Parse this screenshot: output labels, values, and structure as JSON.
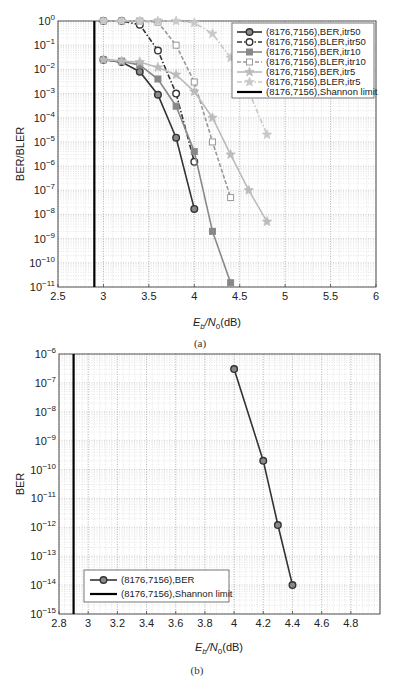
{
  "chart_data": [
    {
      "type": "line",
      "panel": "(a)",
      "caption": "(a)",
      "xlabel": "Eb/N0(dB)",
      "ylabel": "BER/BLER",
      "xscale": "linear",
      "yscale": "log",
      "xlim": [
        2.5,
        6
      ],
      "ylim": [
        1e-11,
        1
      ],
      "xticks": [
        "2.5",
        "3",
        "3.5",
        "4",
        "4.5",
        "5",
        "5.5",
        "6"
      ],
      "yticks": [
        "10^0",
        "10^-1",
        "10^-2",
        "10^-3",
        "10^-4",
        "10^-5",
        "10^-6",
        "10^-7",
        "10^-8",
        "10^-9",
        "10^-10",
        "10^-11"
      ],
      "grid": true,
      "legend_position": "upper right",
      "series": [
        {
          "name": "(8176,7156),BER,itr50",
          "color": "#333333",
          "style": "solid",
          "marker": "circle",
          "x": [
            3.0,
            3.2,
            3.4,
            3.6,
            3.8,
            4.0
          ],
          "y": [
            0.025,
            0.02,
            0.008,
            0.0009,
            1.5e-05,
            1.7e-08
          ]
        },
        {
          "name": "(8176,7156),BLER,itr50",
          "color": "#333333",
          "style": "dashdot",
          "marker": "circle-open",
          "x": [
            3.0,
            3.2,
            3.4,
            3.6,
            3.8,
            4.0
          ],
          "y": [
            1,
            1,
            0.7,
            0.06,
            0.001,
            1.5e-06
          ]
        },
        {
          "name": "(8176,7156),BER,itr10",
          "color": "#888888",
          "style": "solid",
          "marker": "square",
          "x": [
            3.0,
            3.2,
            3.4,
            3.6,
            3.8,
            4.0,
            4.2,
            4.4
          ],
          "y": [
            0.025,
            0.022,
            0.015,
            0.004,
            0.0003,
            4e-06,
            2e-09,
            1.5e-11
          ]
        },
        {
          "name": "(8176,7156),BLER,itr10",
          "color": "#999999",
          "style": "dashed",
          "marker": "square-open",
          "x": [
            3.0,
            3.2,
            3.4,
            3.6,
            3.8,
            4.0,
            4.2,
            4.4
          ],
          "y": [
            1,
            1,
            1,
            0.9,
            0.1,
            0.003,
            1e-05,
            5e-08
          ]
        },
        {
          "name": "(8176,7156),BER,itr5",
          "color": "#bbbbbb",
          "style": "solid",
          "marker": "star",
          "x": [
            3.0,
            3.2,
            3.4,
            3.6,
            3.8,
            4.0,
            4.2,
            4.4,
            4.6,
            4.8
          ],
          "y": [
            0.025,
            0.022,
            0.02,
            0.012,
            0.006,
            0.0012,
            0.0001,
            3e-06,
            1e-07,
            5e-09
          ]
        },
        {
          "name": "(8176,7156),BLER,itr5",
          "color": "#c8c8c8",
          "style": "dashdot",
          "marker": "star-open",
          "x": [
            3.0,
            3.2,
            3.4,
            3.6,
            3.8,
            4.0,
            4.2,
            4.4,
            4.6,
            4.8
          ],
          "y": [
            1,
            1,
            1,
            1,
            1,
            0.85,
            0.3,
            0.03,
            0.0012,
            2e-05
          ]
        },
        {
          "name": "(8176,7156),Shannon limit",
          "color": "#000000",
          "style": "solid",
          "marker": "none",
          "x": [
            2.9,
            2.9
          ],
          "y": [
            1e-11,
            1
          ]
        }
      ]
    },
    {
      "type": "line",
      "panel": "(b)",
      "caption": "(b)",
      "xlabel": "Eb/N0(dB)",
      "ylabel": "BER",
      "xscale": "linear",
      "yscale": "log",
      "xlim": [
        2.8,
        5.0
      ],
      "ylim": [
        1e-15,
        1e-06
      ],
      "xticks": [
        "2.8",
        "3",
        "3.2",
        "3.4",
        "3.6",
        "3.8",
        "4",
        "4.2",
        "4.4",
        "4.6",
        "4.8"
      ],
      "yticks": [
        "10^-6",
        "10^-7",
        "10^-8",
        "10^-9",
        "10^-10",
        "10^-11",
        "10^-12",
        "10^-13",
        "10^-14",
        "10^-15"
      ],
      "grid": true,
      "legend_position": "lower left",
      "series": [
        {
          "name": "(8176,7156),BER",
          "color": "#333333",
          "style": "solid",
          "marker": "circle",
          "x": [
            4.0,
            4.2,
            4.3,
            4.4
          ],
          "y": [
            3e-07,
            2e-10,
            1.2e-12,
            1e-14
          ]
        },
        {
          "name": "(8176,7156),Shannon limit",
          "color": "#000000",
          "style": "solid",
          "marker": "none",
          "x": [
            2.9,
            2.9
          ],
          "y": [
            1e-15,
            1e-06
          ]
        }
      ]
    }
  ],
  "figure": {
    "a": {
      "ylabel": "BER/BLER",
      "xlabel_main": "E",
      "xlabel_sub1": "b",
      "xlabel_mid": "/N",
      "xlabel_sub2": "0",
      "xlabel_unit": "(dB)",
      "caption": "(a)",
      "legend": [
        "(8176,7156),BER,itr50",
        "(8176,7156),BLER,itr50",
        "(8176,7156),BER,itr10",
        "(8176,7156),BLER,itr10",
        "(8176,7156),BER,itr5",
        "(8176,7156),BLER,itr5",
        "(8176,7156),Shannon limit"
      ]
    },
    "b": {
      "ylabel": "BER",
      "xlabel_main": "E",
      "xlabel_sub1": "b",
      "xlabel_mid": "/N",
      "xlabel_sub2": "0",
      "xlabel_unit": "(dB)",
      "caption": "(b)",
      "legend": [
        "(8176,7156),BER",
        "(8176,7156),Shannon limit"
      ]
    }
  }
}
